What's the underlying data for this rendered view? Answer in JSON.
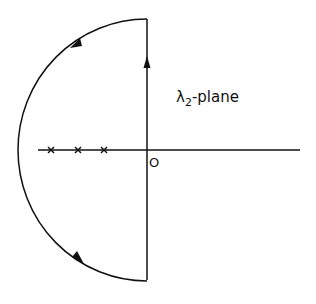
{
  "diagram": {
    "plane_symbol": "λ",
    "plane_subscript": "2",
    "plane_suffix": "-plane",
    "origin_label": "O",
    "poles": [
      {
        "x": 51,
        "y": 150
      },
      {
        "x": 78,
        "y": 150
      },
      {
        "x": 104,
        "y": 150
      }
    ],
    "pole_marker": "×",
    "contour": "Nyquist D-contour enclosing left half-plane",
    "colors": {
      "stroke": "#111111",
      "background": "#ffffff"
    }
  }
}
